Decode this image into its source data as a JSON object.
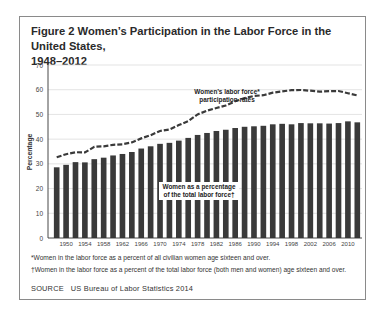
{
  "figure": {
    "title_line1": "Figure 2   Women’s Participation in the Labor Force in the United States,",
    "title_line2": "1948–2012",
    "footnotes": [
      "*Women in the labor force as a percent of all civilian women age sixteen and over.",
      "†Women in the labor force as a percent of the total labor force (both men and women) age sixteen and over."
    ],
    "source_label": "SOURCE",
    "source_text": "US Bureau of Labor Statistics 2014"
  },
  "chart_data": {
    "type": "bar",
    "title": "Women’s Participation in the Labor Force in the United States, 1948–2012",
    "xlabel": "",
    "ylabel": "Percentage",
    "ylim": [
      0,
      70
    ],
    "yticks": [
      0,
      10,
      20,
      30,
      40,
      50,
      60,
      70
    ],
    "xtick_labels": [
      "1950",
      "1954",
      "1958",
      "1962",
      "1966",
      "1970",
      "1974",
      "1978",
      "1982",
      "1986",
      "1990",
      "1994",
      "1998",
      "2002",
      "2006",
      "2010"
    ],
    "grid": true,
    "categories": [
      1948,
      1950,
      1952,
      1954,
      1956,
      1958,
      1960,
      1962,
      1964,
      1966,
      1968,
      1970,
      1972,
      1974,
      1976,
      1978,
      1980,
      1982,
      1984,
      1986,
      1988,
      1990,
      1992,
      1994,
      1996,
      1998,
      2000,
      2002,
      2004,
      2006,
      2008,
      2010,
      2012
    ],
    "series": [
      {
        "name": "Women as a percentage of the total labor force†",
        "type": "bar",
        "color": "#3a3a3a",
        "values": [
          28.6,
          29.6,
          30.7,
          30.6,
          31.9,
          32.5,
          33.4,
          34.0,
          34.8,
          36.2,
          37.1,
          38.1,
          38.5,
          39.4,
          40.5,
          41.7,
          42.5,
          43.3,
          43.8,
          44.5,
          45.0,
          45.2,
          45.4,
          46.0,
          46.2,
          46.0,
          46.5,
          46.4,
          46.4,
          46.3,
          46.5,
          47.2,
          46.8
        ]
      },
      {
        "name": "Women’s labor force* participation rates",
        "type": "line",
        "style": "dashed",
        "color": "#3a3a3a",
        "values": [
          32.7,
          33.9,
          34.7,
          34.6,
          36.9,
          37.1,
          37.7,
          37.9,
          38.7,
          40.3,
          41.6,
          43.3,
          43.9,
          45.7,
          47.3,
          50.0,
          51.5,
          52.6,
          53.6,
          55.3,
          56.6,
          57.5,
          57.8,
          58.8,
          59.3,
          59.8,
          59.9,
          59.6,
          59.2,
          59.4,
          59.5,
          58.6,
          57.7
        ]
      }
    ],
    "annotations": [
      {
        "text": "Women’s labor force*",
        "line": 1
      },
      {
        "text": "participation rates",
        "line": 2
      },
      {
        "text": "Women as a percentage",
        "line": 1
      },
      {
        "text": "of the total labor force†",
        "line": 2
      }
    ]
  }
}
